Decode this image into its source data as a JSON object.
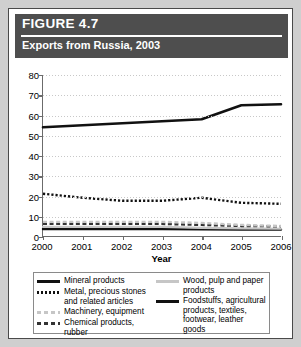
{
  "figure": {
    "number_label": "FIGURE 4.7",
    "subtitle": "Exports from Russia, 2003"
  },
  "chart_data": {
    "type": "line",
    "title": "Exports from Russia, 2003",
    "xlabel": "Year",
    "ylabel": "",
    "categories": [
      "2000",
      "2001",
      "2002",
      "2003",
      "2004",
      "2005",
      "2006"
    ],
    "x": [
      2000,
      2001,
      2002,
      2003,
      2004,
      2005,
      2006
    ],
    "xlim": [
      2000,
      2006
    ],
    "ylim": [
      0,
      80
    ],
    "yticks": [
      0,
      10,
      20,
      30,
      40,
      50,
      60,
      70,
      80
    ],
    "grid": true,
    "legend_position": "bottom",
    "series": [
      {
        "name": "Mineral products",
        "style": "solid-thick",
        "color": "#111111",
        "values": [
          54,
          55,
          56,
          57,
          58,
          65,
          65.5
        ]
      },
      {
        "name": "Metal, precious stones and related articles",
        "style": "dotted",
        "color": "#111111",
        "values": [
          21,
          19,
          17.5,
          17.5,
          19,
          16.5,
          16
        ]
      },
      {
        "name": "Machinery, equipment",
        "style": "dashed-light",
        "color": "#c6c6c6",
        "values": [
          7,
          7,
          7,
          7,
          6.5,
          5.5,
          5
        ]
      },
      {
        "name": "Chemical products, rubber",
        "style": "dashed-dark",
        "color": "#333333",
        "values": [
          6,
          6,
          6,
          6,
          5.5,
          5,
          4.8
        ]
      },
      {
        "name": "Wood, pulp and paper products",
        "style": "solid-light",
        "color": "#c6c6c6",
        "values": [
          4.5,
          4.5,
          4.5,
          4.5,
          4,
          3.8,
          3.6
        ]
      },
      {
        "name": "Foodstuffs, agricultural products, textiles, footwear, leather goods",
        "style": "solid-thick-low",
        "color": "#111111",
        "values": [
          3.5,
          3.5,
          3.5,
          3.5,
          3.3,
          3.2,
          3.2
        ]
      }
    ]
  },
  "legend": {
    "left_column": [
      {
        "label": "Mineral products",
        "swatch": "sw-solid-thick"
      },
      {
        "label": "Metal, precious stones and related articles",
        "swatch": "sw-dotted"
      },
      {
        "label": "Machinery, equipment",
        "swatch": "sw-dash-light"
      },
      {
        "label": "Chemical products, rubber",
        "swatch": "sw-dash-dark"
      }
    ],
    "right_column": [
      {
        "label": "Wood, pulp and paper products",
        "swatch": "sw-solid-light"
      },
      {
        "label": "Foodstuffs, agricultural products, textiles, footwear, leather goods",
        "swatch": "sw-solid-thick"
      }
    ]
  }
}
